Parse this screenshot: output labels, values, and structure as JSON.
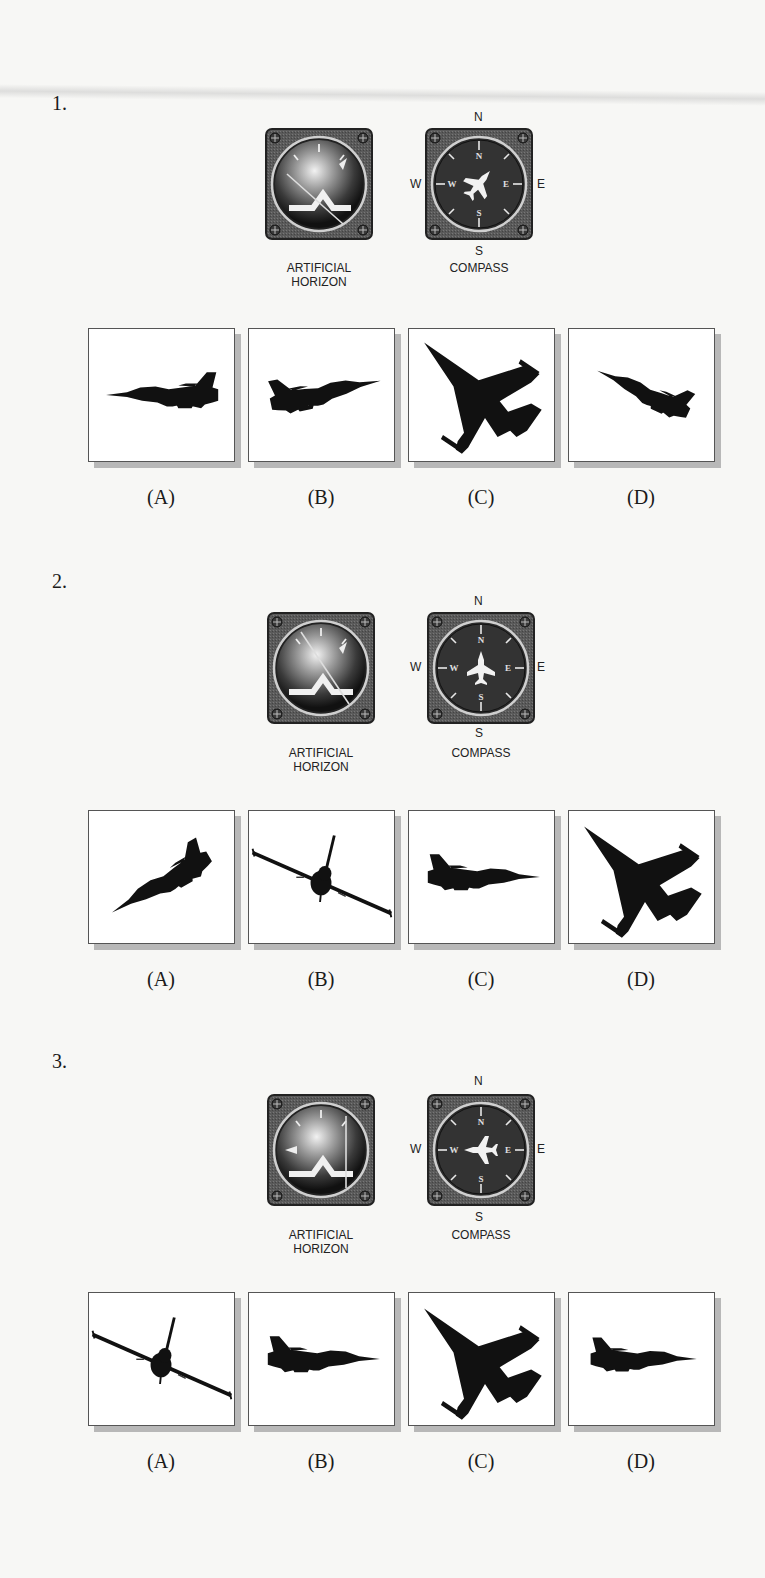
{
  "questions": [
    {
      "number": "1.",
      "instruments": {
        "horizon_label_1": "ARTIFICIAL",
        "horizon_label_2": "HORIZON",
        "compass_label": "COMPASS",
        "cardinals": {
          "n": "N",
          "s": "S",
          "e": "E",
          "w": "W"
        },
        "horizon_state": "banked-left-nose-up",
        "compass_heading": "northeast"
      },
      "options": [
        {
          "label": "(A)",
          "icon": "jet-side-view-left-level"
        },
        {
          "label": "(B)",
          "icon": "jet-side-view-right-climbing"
        },
        {
          "label": "(C)",
          "icon": "jet-top-view-banked"
        },
        {
          "label": "(D)",
          "icon": "jet-side-view-left-climbing"
        }
      ]
    },
    {
      "number": "2.",
      "instruments": {
        "horizon_label_1": "ARTIFICIAL",
        "horizon_label_2": "HORIZON",
        "compass_label": "COMPASS",
        "cardinals": {
          "n": "N",
          "s": "S",
          "e": "E",
          "w": "W"
        },
        "horizon_state": "banked-left-nose-up",
        "compass_heading": "north"
      },
      "options": [
        {
          "label": "(A)",
          "icon": "jet-side-view-left-climbing-steep"
        },
        {
          "label": "(B)",
          "icon": "jet-head-on-banked"
        },
        {
          "label": "(C)",
          "icon": "jet-side-view-right-level"
        },
        {
          "label": "(D)",
          "icon": "jet-top-view-banked"
        }
      ]
    },
    {
      "number": "3.",
      "instruments": {
        "horizon_label_1": "ARTIFICIAL",
        "horizon_label_2": "HORIZON",
        "compass_label": "COMPASS",
        "cardinals": {
          "n": "N",
          "s": "S",
          "e": "E",
          "w": "W"
        },
        "horizon_state": "banked-right-level",
        "compass_heading": "west"
      },
      "options": [
        {
          "label": "(A)",
          "icon": "jet-head-on-banked"
        },
        {
          "label": "(B)",
          "icon": "jet-side-view-right-level"
        },
        {
          "label": "(C)",
          "icon": "jet-top-view-banked"
        },
        {
          "label": "(D)",
          "icon": "jet-top-view-right-level"
        }
      ]
    }
  ]
}
